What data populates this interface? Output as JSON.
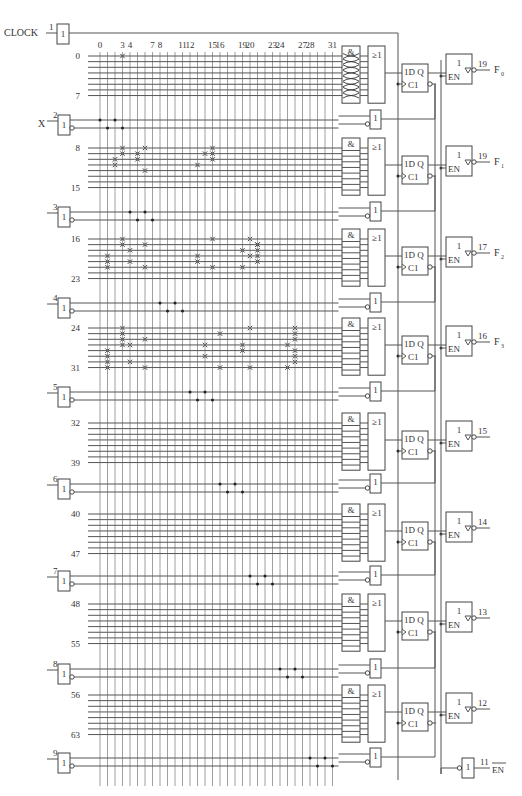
{
  "clock": {
    "label": "CLOCK",
    "pin": "1",
    "gate_symbol": "1"
  },
  "column_labels": [
    "0",
    "3",
    "4",
    "7",
    "8",
    "11",
    "12",
    "15",
    "16",
    "19",
    "20",
    "23",
    "24",
    "27",
    "28",
    "31"
  ],
  "column_label_indices": [
    0,
    3,
    4,
    7,
    8,
    11,
    12,
    15,
    16,
    19,
    20,
    23,
    24,
    27,
    28,
    31
  ],
  "num_columns": 32,
  "inputs": [
    {
      "pin": "2",
      "name": "X",
      "buffer_symbol": "1",
      "columns": [
        0,
        1,
        2,
        3
      ]
    },
    {
      "pin": "3",
      "name": "",
      "buffer_symbol": "1",
      "columns": [
        4,
        5,
        6,
        7
      ]
    },
    {
      "pin": "4",
      "name": "",
      "buffer_symbol": "1",
      "columns": [
        8,
        9,
        10,
        11
      ]
    },
    {
      "pin": "5",
      "name": "",
      "buffer_symbol": "1",
      "columns": [
        12,
        13,
        14,
        15
      ]
    },
    {
      "pin": "6",
      "name": "",
      "buffer_symbol": "1",
      "columns": [
        16,
        17,
        18,
        19
      ]
    },
    {
      "pin": "7",
      "name": "",
      "buffer_symbol": "1",
      "columns": [
        20,
        21,
        22,
        23
      ]
    },
    {
      "pin": "8",
      "name": "",
      "buffer_symbol": "1",
      "columns": [
        24,
        25,
        26,
        27
      ]
    },
    {
      "pin": "9",
      "name": "",
      "buffer_symbol": "1",
      "columns": [
        28,
        29,
        30,
        31
      ]
    }
  ],
  "product_groups": [
    {
      "first": "0",
      "last": "7",
      "fuses": [
        [
          0,
          3
        ]
      ],
      "and_all_intact": true
    },
    {
      "first": "8",
      "last": "15",
      "fuses": [
        [
          0,
          3
        ],
        [
          0,
          6
        ],
        [
          1,
          3
        ],
        [
          1,
          5
        ],
        [
          1,
          14
        ],
        [
          2,
          5
        ],
        [
          2,
          2
        ],
        [
          3,
          2
        ],
        [
          4,
          6
        ],
        [
          0,
          15
        ],
        [
          1,
          15
        ],
        [
          2,
          15
        ],
        [
          3,
          13
        ]
      ],
      "and_all_intact": false
    },
    {
      "first": "16",
      "last": "23",
      "fuses": [
        [
          0,
          3
        ],
        [
          0,
          15
        ],
        [
          0,
          20
        ],
        [
          1,
          3
        ],
        [
          1,
          6
        ],
        [
          1,
          21
        ],
        [
          2,
          4
        ],
        [
          2,
          19
        ],
        [
          3,
          1
        ],
        [
          3,
          13
        ],
        [
          3,
          20
        ],
        [
          4,
          1
        ],
        [
          4,
          4
        ],
        [
          4,
          13
        ],
        [
          4,
          21
        ],
        [
          5,
          1
        ],
        [
          5,
          6
        ],
        [
          5,
          15
        ],
        [
          5,
          19
        ],
        [
          1,
          21
        ],
        [
          2,
          21
        ],
        [
          3,
          21
        ]
      ],
      "and_all_intact": false
    },
    {
      "first": "24",
      "last": "31",
      "fuses": [
        [
          0,
          3
        ],
        [
          0,
          20
        ],
        [
          0,
          26
        ],
        [
          1,
          3
        ],
        [
          1,
          16
        ],
        [
          1,
          26
        ],
        [
          2,
          3
        ],
        [
          2,
          6
        ],
        [
          2,
          26
        ],
        [
          3,
          3
        ],
        [
          3,
          4
        ],
        [
          3,
          14
        ],
        [
          3,
          19
        ],
        [
          3,
          25
        ],
        [
          4,
          1
        ],
        [
          4,
          19
        ],
        [
          4,
          26
        ],
        [
          5,
          1
        ],
        [
          5,
          14
        ],
        [
          5,
          26
        ],
        [
          6,
          1
        ],
        [
          6,
          4
        ],
        [
          6,
          26
        ],
        [
          7,
          1
        ],
        [
          7,
          6
        ],
        [
          7,
          16
        ],
        [
          7,
          20
        ],
        [
          7,
          25
        ]
      ],
      "and_all_intact": false
    },
    {
      "first": "32",
      "last": "39",
      "fuses": [],
      "and_all_intact": false
    },
    {
      "first": "40",
      "last": "47",
      "fuses": [],
      "and_all_intact": false
    },
    {
      "first": "48",
      "last": "55",
      "fuses": [],
      "and_all_intact": false
    },
    {
      "first": "56",
      "last": "63",
      "fuses": [],
      "and_all_intact": false
    }
  ],
  "macrocells": [
    {
      "and_symbol": "&",
      "or_symbol": "≥1",
      "ff_d": "1D Q",
      "ff_c": "C1",
      "buf_symbol": "1",
      "en": "EN",
      "pin": "19",
      "signal": "F",
      "sub": "0"
    },
    {
      "and_symbol": "&",
      "or_symbol": "≥1",
      "ff_d": "1D Q",
      "ff_c": "C1",
      "buf_symbol": "1",
      "en": "EN",
      "pin": "19",
      "signal": "F",
      "sub": "1"
    },
    {
      "and_symbol": "&",
      "or_symbol": "≥1",
      "ff_d": "1D Q",
      "ff_c": "C1",
      "buf_symbol": "1",
      "en": "EN",
      "pin": "17",
      "signal": "F",
      "sub": "2"
    },
    {
      "and_symbol": "&",
      "or_symbol": "≥1",
      "ff_d": "1D Q",
      "ff_c": "C1",
      "buf_symbol": "1",
      "en": "EN",
      "pin": "16",
      "signal": "F",
      "sub": "3"
    },
    {
      "and_symbol": "&",
      "or_symbol": "≥1",
      "ff_d": "1D Q",
      "ff_c": "C1",
      "buf_symbol": "1",
      "en": "EN",
      "pin": "15",
      "signal": "",
      "sub": ""
    },
    {
      "and_symbol": "&",
      "or_symbol": "≥1",
      "ff_d": "1D Q",
      "ff_c": "C1",
      "buf_symbol": "1",
      "en": "EN",
      "pin": "14",
      "signal": "",
      "sub": ""
    },
    {
      "and_symbol": "&",
      "or_symbol": "≥1",
      "ff_d": "1D Q",
      "ff_c": "C1",
      "buf_symbol": "1",
      "en": "EN",
      "pin": "13",
      "signal": "",
      "sub": ""
    },
    {
      "and_symbol": "&",
      "or_symbol": "≥1",
      "ff_d": "1D Q",
      "ff_c": "C1",
      "buf_symbol": "1",
      "en": "EN",
      "pin": "12",
      "signal": "",
      "sub": ""
    }
  ],
  "output_enable": {
    "pin": "11",
    "label": "EN",
    "overline": true,
    "buffer_symbol": "1"
  },
  "feedback_buffer_symbol": "1"
}
